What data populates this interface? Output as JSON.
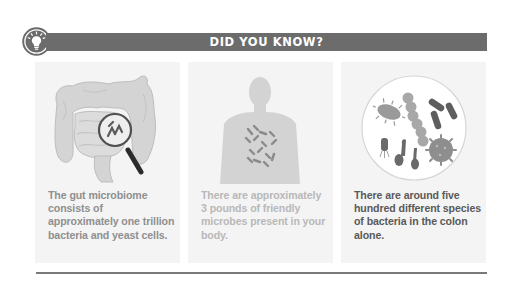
{
  "header": {
    "title": "DID YOU KNOW?",
    "icon": "lightbulb-icon",
    "bar_color": "#6c6c6c",
    "title_color": "#ffffff"
  },
  "panels": [
    {
      "illustration": "intestine-magnifier-illustration",
      "text": "The gut microbiome consists of approximately one trillion bacteria and yeast cells.",
      "text_color": "#8f8f8f"
    },
    {
      "illustration": "human-silhouette-microbes-illustration",
      "text": "There are approximately 3 pounds of friendly microbes present in your body.",
      "text_color": "#b8b8b8"
    },
    {
      "illustration": "bacteria-petri-circle-illustration",
      "text": "There are around five hundred different species of bacteria in the colon alone.",
      "text_color": "#5a5a5a"
    }
  ],
  "colors": {
    "panel_background": "#f4f4f4",
    "divider": "#7a7a7a"
  }
}
